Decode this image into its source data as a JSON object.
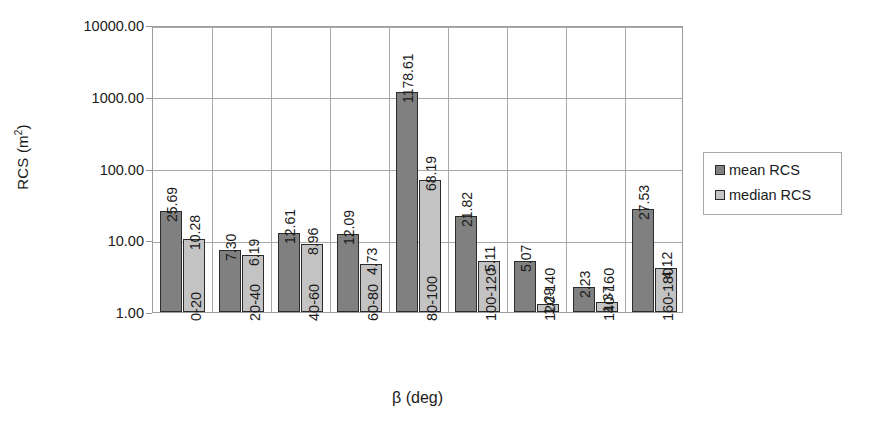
{
  "chart_data": {
    "type": "bar",
    "title": "",
    "xlabel": "β (deg)",
    "ylabel": "RCS (m²)",
    "yscale": "log",
    "ylim": [
      1.0,
      10000.0
    ],
    "y_ticks": [
      "1.00",
      "10.00",
      "100.00",
      "1000.00",
      "10000.00"
    ],
    "grid": true,
    "legend_position": "right",
    "categories": [
      "0-20",
      "20-40",
      "40-60",
      "60-80",
      "80-100",
      "100-120",
      "120-140",
      "140-160",
      "160-180"
    ],
    "series": [
      {
        "name": "mean RCS",
        "color": "#808080",
        "values": [
          25.69,
          7.3,
          12.61,
          12.09,
          1178.61,
          21.82,
          5.07,
          2.23,
          27.53
        ],
        "labels": [
          "25.69",
          "7.30",
          "12.61",
          "12.09",
          "1178.61",
          "21.82",
          "5.07",
          "2.23",
          "27.53"
        ]
      },
      {
        "name": "median RCS",
        "color": "#c3c3c3",
        "values": [
          10.28,
          6.19,
          8.96,
          4.73,
          68.19,
          5.11,
          1.29,
          1.37,
          4.12
        ],
        "labels": [
          "10.28",
          "6.19",
          "8.96",
          "4.73",
          "68.19",
          "5.11",
          "1.29",
          "1.37",
          "4.12"
        ]
      }
    ]
  },
  "legend": {
    "items": [
      {
        "label": "mean RCS",
        "color": "#808080"
      },
      {
        "label": "median RCS",
        "color": "#c3c3c3"
      }
    ]
  },
  "axes": {
    "y_title": "RCS (m²)",
    "y_title_base": "RCS (m",
    "y_title_sup": "2",
    "y_title_close": ")",
    "x_title": "β (deg)"
  }
}
